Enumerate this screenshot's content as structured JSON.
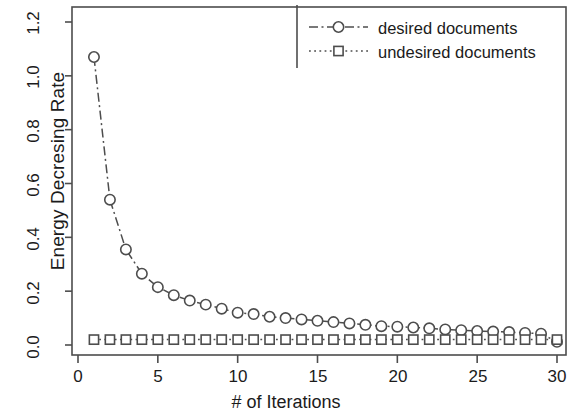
{
  "chart_data": {
    "type": "line",
    "title": "",
    "xlabel": "# of Iterations",
    "ylabel": "Energy Decresing Rate",
    "xlim": [
      0,
      30.5
    ],
    "ylim": [
      -0.02,
      1.25
    ],
    "grid": false,
    "legend_position": "top-right",
    "x": [
      1,
      2,
      3,
      4,
      5,
      6,
      7,
      8,
      9,
      10,
      11,
      12,
      13,
      14,
      15,
      16,
      17,
      18,
      19,
      20,
      21,
      22,
      23,
      24,
      25,
      26,
      27,
      28,
      29,
      30
    ],
    "series": [
      {
        "name": "desired documents",
        "marker": "circle",
        "linestyle": "dashdot",
        "values": [
          1.07,
          0.54,
          0.355,
          0.265,
          0.215,
          0.185,
          0.165,
          0.15,
          0.135,
          0.12,
          0.115,
          0.105,
          0.1,
          0.095,
          0.09,
          0.085,
          0.08,
          0.075,
          0.07,
          0.068,
          0.065,
          0.062,
          0.058,
          0.055,
          0.052,
          0.05,
          0.048,
          0.045,
          0.042,
          0.012
        ]
      },
      {
        "name": "undesired documents",
        "marker": "square",
        "linestyle": "dotted",
        "values": [
          0.02,
          0.02,
          0.02,
          0.02,
          0.02,
          0.02,
          0.02,
          0.02,
          0.02,
          0.02,
          0.02,
          0.02,
          0.02,
          0.02,
          0.02,
          0.02,
          0.02,
          0.02,
          0.02,
          0.02,
          0.02,
          0.02,
          0.02,
          0.02,
          0.02,
          0.02,
          0.02,
          0.02,
          0.02,
          0.02
        ]
      }
    ],
    "yticks": [
      0.0,
      0.2,
      0.4,
      0.6,
      0.8,
      1.0,
      1.2
    ],
    "ytick_labels": [
      "0.0",
      "0.2",
      "0.4",
      "0.6",
      "0.8",
      "1.0",
      "1.2"
    ],
    "xticks": [
      0,
      5,
      10,
      15,
      20,
      25,
      30
    ],
    "xtick_labels": [
      "0",
      "5",
      "10",
      "15",
      "20",
      "25",
      "30"
    ],
    "line_color": "#4d4d4d",
    "axis_color": "#4d4d4d"
  },
  "axes": {
    "ylabel": "Energy Decresing Rate",
    "xlabel": "# of Iterations",
    "ytick_0": "0.0",
    "ytick_1": "0.2",
    "ytick_2": "0.4",
    "ytick_3": "0.6",
    "ytick_4": "0.8",
    "ytick_5": "1.0",
    "ytick_6": "1.2",
    "xtick_0": "0",
    "xtick_1": "5",
    "xtick_2": "10",
    "xtick_3": "15",
    "xtick_4": "20",
    "xtick_5": "25",
    "xtick_6": "30"
  },
  "legend": {
    "entry_0": "desired documents",
    "entry_1": "undesired documents"
  }
}
